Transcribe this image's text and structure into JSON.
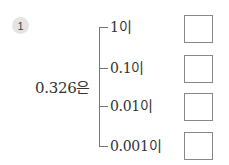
{
  "problem": {
    "number": "1",
    "stem": "0.326은",
    "branches": [
      {
        "label": "1이",
        "answer": ""
      },
      {
        "label": "0.1이",
        "answer": ""
      },
      {
        "label": "0.01이",
        "answer": ""
      },
      {
        "label": "0.001이",
        "answer": ""
      }
    ]
  }
}
